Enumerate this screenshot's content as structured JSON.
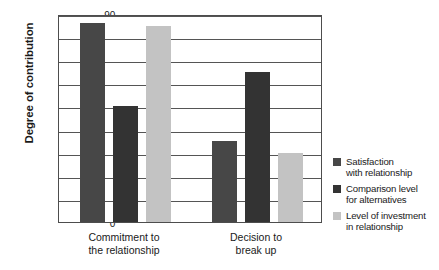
{
  "chart_data": {
    "type": "bar",
    "title": "",
    "xlabel": "",
    "ylabel": "Degree of contribution",
    "ylim": [
      0,
      0.9
    ],
    "grid": true,
    "legend_position": "right",
    "categories": [
      "Commitment to\nthe relationship",
      "Decision to\nbreak up"
    ],
    "y_ticks": [
      "0",
      ".10",
      ".20",
      ".30",
      ".40",
      ".50",
      ".60",
      ".70",
      ".80",
      ".90"
    ],
    "y_tick_values": [
      0,
      0.1,
      0.2,
      0.3,
      0.4,
      0.5,
      0.6,
      0.7,
      0.8,
      0.9
    ],
    "series": [
      {
        "name": "Satisfaction\nwith relationship",
        "color": "#474747",
        "values": [
          0.86,
          0.35
        ]
      },
      {
        "name": "Comparison level\nfor alternatives",
        "color": "#333333",
        "values": [
          0.5,
          0.65
        ]
      },
      {
        "name": "Level of investment\nin relationship",
        "color": "#c3c3c3",
        "values": [
          0.85,
          0.3
        ]
      }
    ]
  },
  "colors": {
    "axis": "#4d4d4d",
    "gridline": "#555555",
    "text": "#1a1a1a",
    "background": "#ffffff"
  }
}
